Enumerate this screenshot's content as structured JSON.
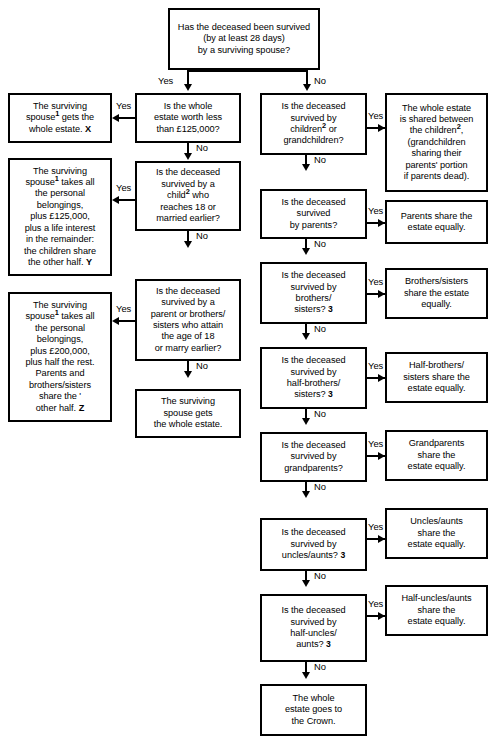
{
  "diagram": {
    "labels": {
      "yes": "Yes",
      "no": "No"
    },
    "colors": {
      "line": "#000000",
      "background": "#ffffff",
      "text": "#000000"
    }
  },
  "nodes": {
    "root": {
      "line1": "Has the deceased been survived",
      "line2": "(by at least 28 days)",
      "line3": "by a surviving spouse?"
    },
    "q_estate_value": {
      "line1": "Is the whole",
      "line2": "estate worth less",
      "line3": "than £125,000?"
    },
    "a_whole_estate_x": {
      "line1": "The surviving",
      "line2_pre": "spouse",
      "line2_sup": "1",
      "line2_post": " gets the",
      "line3": "whole estate.",
      "tag": "X"
    },
    "q_child_18": {
      "line1": "Is the deceased",
      "line2": "survived by a",
      "line3_pre": "child",
      "line3_sup": "2",
      "line3_post": " who",
      "line4": "reaches 18 or",
      "line5": "married earlier?"
    },
    "a_spouse_y": {
      "line1": "The surviving",
      "line2_pre": "spouse",
      "line2_sup": "1",
      "line2_post": " takes all",
      "line3": "the personal",
      "line4": "belongings,",
      "line5": "plus £125,000,",
      "line6": "plus a life interest",
      "line7": "in the remainder:",
      "line8": "the children share",
      "line9": "the other half.",
      "tag": "Y"
    },
    "q_parent_siblings_18": {
      "line1": "Is the deceased",
      "line2": "survived by a",
      "line3": "parent or brothers/",
      "line4": "sisters who attain",
      "line5": "the age of 18",
      "line6": "or marry earlier?"
    },
    "a_spouse_z": {
      "line1": "The surviving",
      "line2_pre": "spouse",
      "line2_sup": "1",
      "line2_post": " takes all",
      "line3": "the personal",
      "line4": "belongings,",
      "line5": "plus £200,000,",
      "line6": "plus half the rest.",
      "line7": "Parents and",
      "line8": "brothers/sisters",
      "line9": "share the '",
      "line10": "other half.",
      "tag": "Z"
    },
    "a_spouse_whole": {
      "line1": "The surviving",
      "line2": "spouse gets",
      "line3": "the whole estate."
    },
    "q_children": {
      "line1": "Is the deceased",
      "line2": "survived by",
      "line3_pre": "children",
      "line3_sup": "2",
      "line3_post": " or",
      "line4": "grandchildren?"
    },
    "a_children": {
      "line1": "The whole estate",
      "line2": "is shared between",
      "line3_pre": "the children",
      "line3_sup": "2",
      "line3_post": ",",
      "line4": "(grandchildren",
      "line5": "sharing their",
      "line6": "parents' portion",
      "line7": "if parents dead)."
    },
    "q_parents": {
      "line1": "Is the deceased",
      "line2": "survived",
      "line3": "by parents?"
    },
    "a_parents": {
      "line1": "Parents share the",
      "line2": "estate equally."
    },
    "q_siblings": {
      "line1": "Is the deceased",
      "line2": "survived by",
      "line3": "brothers/",
      "line4_pre": "sisters? ",
      "line4_note": "3"
    },
    "a_siblings": {
      "line1": "Brothers/sisters",
      "line2": "share the estate",
      "line3": "equally."
    },
    "q_half_siblings": {
      "line1": "Is the deceased",
      "line2": "survived by",
      "line3": "half-brothers/",
      "line4_pre": "sisters? ",
      "line4_note": "3"
    },
    "a_half_siblings": {
      "line1": "Half-brothers/",
      "line2": "sisters share the",
      "line3": "estate equally."
    },
    "q_grandparents": {
      "line1": "Is the deceased",
      "line2": "survived by",
      "line3": "grandparents?"
    },
    "a_grandparents": {
      "line1": "Grandparents",
      "line2": "share the",
      "line3": "estate equally."
    },
    "q_uncles_aunts": {
      "line1": "Is the deceased",
      "line2": "survived by",
      "line3_pre": "uncles/aunts? ",
      "line3_note": "3"
    },
    "a_uncles_aunts": {
      "line1": "Uncles/aunts",
      "line2": "share the",
      "line3": "estate equally."
    },
    "q_half_uncles_aunts": {
      "line1": "Is the deceased",
      "line2": "survived by",
      "line3": "half-uncles/",
      "line4_pre": "aunts? ",
      "line4_note": "3"
    },
    "a_half_uncles_aunts": {
      "line1": "Half-uncles/aunts",
      "line2": "share the",
      "line3": "estate equally."
    },
    "a_crown": {
      "line1": "The whole",
      "line2": "estate goes to",
      "line3": "the Crown."
    }
  }
}
